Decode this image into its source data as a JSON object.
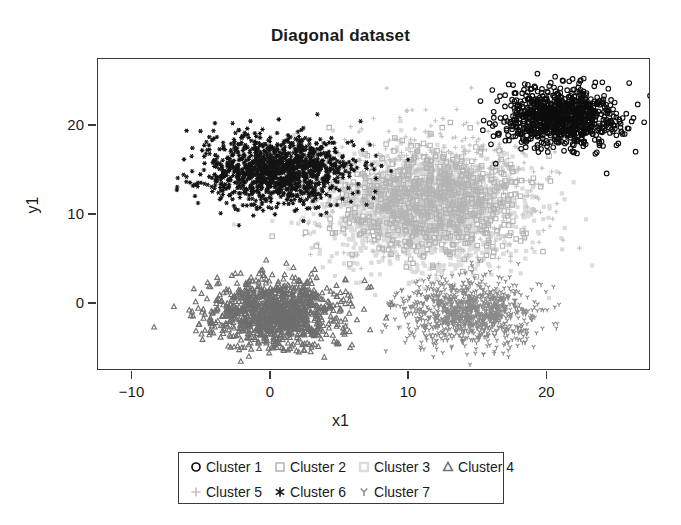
{
  "chart_data": {
    "type": "scatter",
    "title": "Diagonal dataset",
    "xlabel": "x1",
    "ylabel": "y1",
    "xlim": [
      -12.5,
      27.5
    ],
    "ylim": [
      -7.5,
      27.5
    ],
    "xticks": [
      -10,
      0,
      10,
      20
    ],
    "xtick_labels": [
      "−10",
      "0",
      "10",
      "20"
    ],
    "yticks": [
      0,
      10,
      20
    ],
    "ytick_labels": [
      "0",
      "10",
      "20"
    ],
    "grid": false,
    "legend_position": "below-center",
    "n_series": 7,
    "series": [
      {
        "name": "Cluster 1",
        "marker": "circle-open",
        "color": "#0d0d0d",
        "center_x": 21.0,
        "center_y": 21.0,
        "spread_x": 2.1,
        "spread_y": 1.7,
        "n_points": 900,
        "marker_size": 4.6
      },
      {
        "name": "Cluster 2",
        "marker": "square-open",
        "color": "#b4b4b4",
        "center_x": 11.5,
        "center_y": 11.5,
        "spread_x": 3.4,
        "spread_y": 3.0,
        "n_points": 700,
        "marker_size": 4.4
      },
      {
        "name": "Cluster 3",
        "marker": "square-filled-light",
        "color": "#dcdcdc",
        "center_x": 11.0,
        "center_y": 10.5,
        "spread_x": 3.6,
        "spread_y": 3.2,
        "n_points": 1500,
        "marker_size": 4.2
      },
      {
        "name": "Cluster 4",
        "marker": "triangle-open",
        "color": "#6e6e6e",
        "center_x": 0.3,
        "center_y": -1.0,
        "spread_x": 2.4,
        "spread_y": 1.9,
        "n_points": 1100,
        "marker_size": 4.6
      },
      {
        "name": "Cluster 5",
        "marker": "plus",
        "color": "#c3c3c3",
        "center_x": 12.0,
        "center_y": 12.5,
        "spread_x": 3.8,
        "spread_y": 3.6,
        "n_points": 800,
        "marker_size": 4.6
      },
      {
        "name": "Cluster 6",
        "marker": "asterisk",
        "color": "#141414",
        "center_x": 0.5,
        "center_y": 15.0,
        "spread_x": 2.6,
        "spread_y": 1.9,
        "n_points": 1200,
        "marker_size": 4.6
      },
      {
        "name": "Cluster 7",
        "marker": "y-mark",
        "color": "#8a8a8a",
        "center_x": 14.2,
        "center_y": -1.0,
        "spread_x": 2.4,
        "spread_y": 1.8,
        "n_points": 1000,
        "marker_size": 4.4
      }
    ]
  },
  "legend": {
    "rows": [
      [
        "Cluster 1",
        "Cluster 2",
        "Cluster 3",
        "Cluster 4"
      ],
      [
        "Cluster 5",
        "Cluster 6",
        "Cluster 7"
      ]
    ]
  }
}
